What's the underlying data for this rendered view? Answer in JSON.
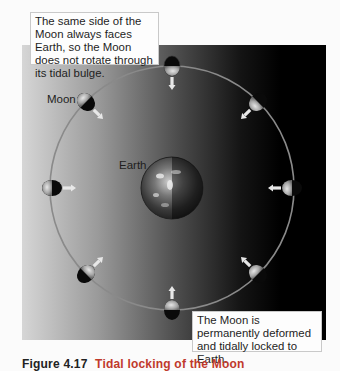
{
  "figure": {
    "callouts": {
      "top_left": "The same side of the Moon always faces Earth, so the Moon does not rotate through its tidal bulge.",
      "bottom_right": "The Moon is permanently deformed and tidally locked to Earth."
    },
    "labels": {
      "moon": "Moon",
      "earth": "Earth"
    },
    "caption": {
      "figure_number": "Figure 4.17",
      "title_partial": "Tidal locking of the Moon"
    },
    "colors": {
      "orbit": "#8a8a8a",
      "caption_title": "#c0392b",
      "panel_dark": "#000000",
      "panel_light": "#d6d6d6"
    },
    "orbit": {
      "center_x": 172,
      "center_y": 188,
      "radius": 122
    },
    "earth": {
      "center_x": 172,
      "center_y": 188,
      "radius": 31
    },
    "moons": [
      {
        "position": "top",
        "angle_deg": 270
      },
      {
        "position": "upper-right",
        "angle_deg": 315
      },
      {
        "position": "right",
        "angle_deg": 0
      },
      {
        "position": "lower-right",
        "angle_deg": 45
      },
      {
        "position": "bottom",
        "angle_deg": 90
      },
      {
        "position": "lower-left",
        "angle_deg": 135
      },
      {
        "position": "left",
        "angle_deg": 180
      },
      {
        "position": "upper-left",
        "angle_deg": 225
      }
    ]
  }
}
